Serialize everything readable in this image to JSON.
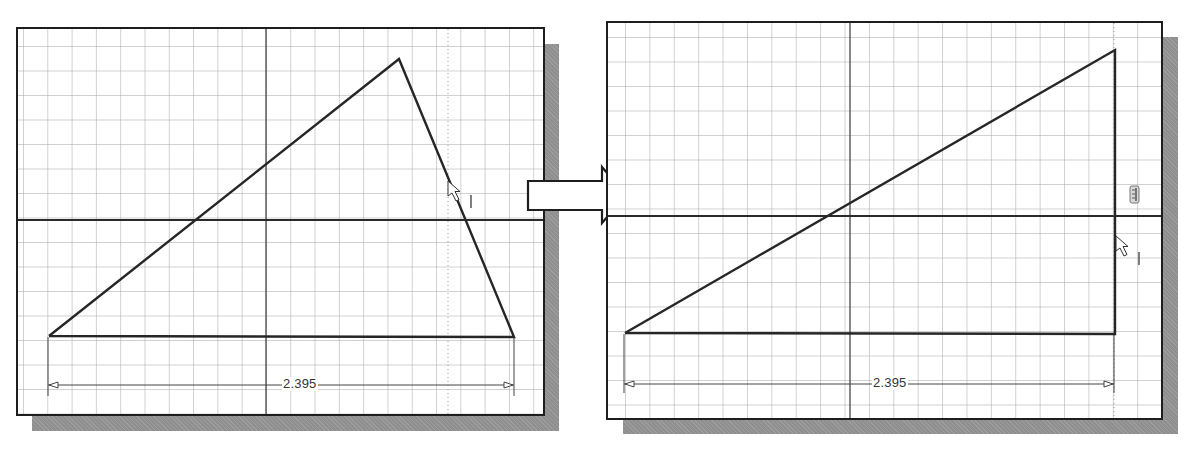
{
  "figure": {
    "left_panel": {
      "name": "sketch-before",
      "dimension_label": "2.395",
      "triangle": {
        "points": [
          [
            47,
            334
          ],
          [
            397,
            57
          ],
          [
            512,
            335
          ]
        ]
      }
    },
    "right_panel": {
      "name": "sketch-after",
      "dimension_label": "2.395",
      "triangle": {
        "points": [
          [
            624,
            332
          ],
          [
            1113,
            49
          ],
          [
            1113,
            333
          ]
        ]
      },
      "constraint_icon": "vertical-constraint-icon"
    },
    "transition_arrow": "right-arrow",
    "colors": {
      "line": "#262626",
      "grid": "#c8c8c8",
      "shadow": "#8f8f8f",
      "border": "#1e1e1e"
    }
  }
}
